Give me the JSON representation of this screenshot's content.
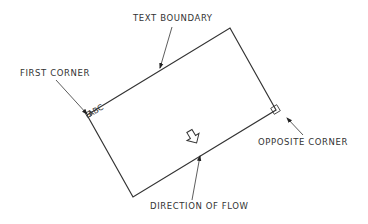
{
  "diagram": {
    "labels": {
      "text_boundary": "TEXT BOUNDARY",
      "first_corner": "FIRST CORNER",
      "opposite_corner": "OPPOSITE CORNER",
      "direction_of_flow": "DIRECTION OF FLOW"
    },
    "corner_text": "ABC",
    "line_color": "#333333",
    "background": "#ffffff"
  }
}
